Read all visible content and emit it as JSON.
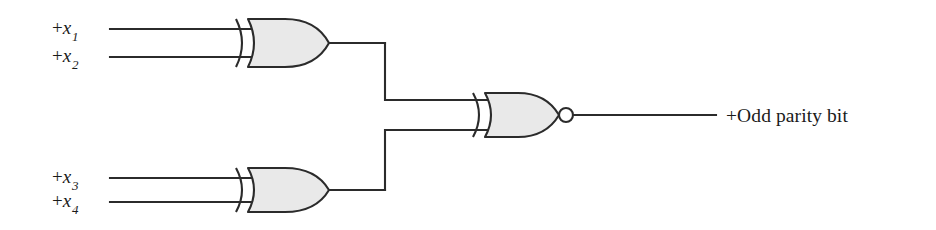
{
  "diagram": {
    "background_color": "#ffffff",
    "line_color": "#2b2b2b",
    "gate_fill_color": "#e9e9e9",
    "inputs": [
      {
        "id": "x1",
        "prefix": "+",
        "variable": "x",
        "subscript": "1",
        "label": "+x1"
      },
      {
        "id": "x2",
        "prefix": "+",
        "variable": "x",
        "subscript": "2",
        "label": "+x2"
      },
      {
        "id": "x3",
        "prefix": "+",
        "variable": "x",
        "subscript": "3",
        "label": "+x3"
      },
      {
        "id": "x4",
        "prefix": "+",
        "variable": "x",
        "subscript": "4",
        "label": "+x4"
      }
    ],
    "output": {
      "id": "odd-parity-bit",
      "label": "+Odd parity bit"
    },
    "gates": [
      {
        "id": "xor-top",
        "type": "XOR",
        "inputs": [
          "x1",
          "x2"
        ],
        "output": "n1"
      },
      {
        "id": "xor-bottom",
        "type": "XOR",
        "inputs": [
          "x3",
          "x4"
        ],
        "output": "n2"
      },
      {
        "id": "xnor-out",
        "type": "XNOR",
        "inputs": [
          "n1",
          "n2"
        ],
        "output": "odd-parity-bit"
      }
    ]
  }
}
